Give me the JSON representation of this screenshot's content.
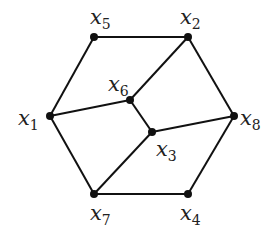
{
  "diagram": {
    "type": "graph",
    "nodes": [
      {
        "id": "x1",
        "base": "x",
        "sub": "1",
        "x": 50,
        "y": 116,
        "lx": 18,
        "ly": 125
      },
      {
        "id": "x2",
        "base": "x",
        "sub": "2",
        "x": 188,
        "y": 37,
        "lx": 180,
        "ly": 24
      },
      {
        "id": "x3",
        "base": "x",
        "sub": "3",
        "x": 152,
        "y": 132,
        "lx": 156,
        "ly": 156
      },
      {
        "id": "x4",
        "base": "x",
        "sub": "4",
        "x": 188,
        "y": 194,
        "lx": 180,
        "ly": 220
      },
      {
        "id": "x5",
        "base": "x",
        "sub": "5",
        "x": 94,
        "y": 37,
        "lx": 90,
        "ly": 24
      },
      {
        "id": "x6",
        "base": "x",
        "sub": "6",
        "x": 130,
        "y": 100,
        "lx": 108,
        "ly": 91
      },
      {
        "id": "x7",
        "base": "x",
        "sub": "7",
        "x": 94,
        "y": 194,
        "lx": 90,
        "ly": 220
      },
      {
        "id": "x8",
        "base": "x",
        "sub": "8",
        "x": 234,
        "y": 116,
        "lx": 240,
        "ly": 125
      }
    ],
    "edges": [
      [
        "x5",
        "x2"
      ],
      [
        "x2",
        "x8"
      ],
      [
        "x8",
        "x4"
      ],
      [
        "x4",
        "x7"
      ],
      [
        "x7",
        "x1"
      ],
      [
        "x1",
        "x5"
      ],
      [
        "x1",
        "x6"
      ],
      [
        "x6",
        "x2"
      ],
      [
        "x6",
        "x3"
      ],
      [
        "x3",
        "x8"
      ],
      [
        "x3",
        "x7"
      ]
    ],
    "colors": {
      "edge": "#111111",
      "node": "#111111",
      "label": "#222222",
      "background": "#ffffff"
    }
  }
}
